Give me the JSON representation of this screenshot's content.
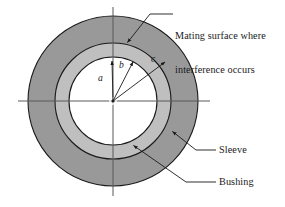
{
  "figure": {
    "background_color": "#ffffff",
    "center": {
      "x": 113,
      "y": 101
    },
    "geometry": {
      "radius_a_label": "a",
      "radius_b_label": "b",
      "radius_c_label": "c",
      "bore_radius_px": 44,
      "mating_radius_px": 58,
      "outer_radius_px": 85
    },
    "colors": {
      "outer_ring_fill": "#999999",
      "inner_ring_fill": "#bfbfbf",
      "bore_fill": "#ffffff",
      "outline": "#1a1a1a",
      "axis": "#4d4d4d",
      "leader": "#333333",
      "text": "#1a1a1a"
    }
  },
  "callouts": {
    "mating_line1": "Mating surface where",
    "mating_line2": "interference occurs",
    "sleeve": "Sleeve",
    "bushing": "Bushing"
  },
  "radius_labels": {
    "a": "a",
    "b": "b",
    "c": "c"
  }
}
